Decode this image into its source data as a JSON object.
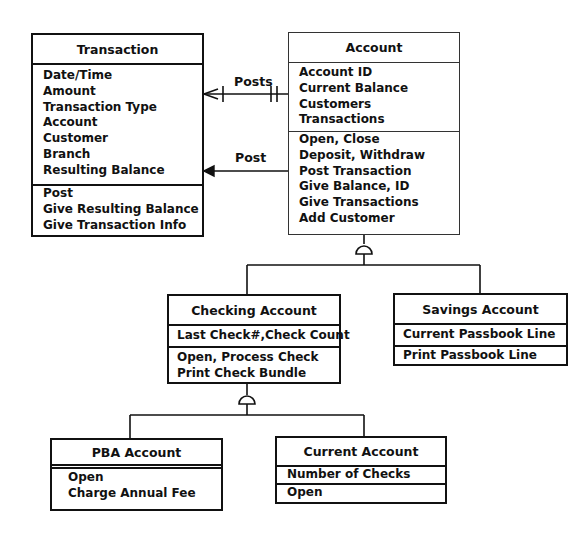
{
  "diagram_type": "UML class diagram",
  "classes": {
    "transaction": {
      "name": "Transaction",
      "attributes": [
        "Date/Time",
        "Amount",
        "Transaction Type",
        "Account",
        "Customer",
        "Branch",
        "Resulting Balance"
      ],
      "operations": [
        "Post",
        "Give Resulting Balance",
        "Give Transaction Info"
      ]
    },
    "account": {
      "name": "Account",
      "attributes": [
        "Account ID",
        "Current Balance",
        "Customers",
        "Transactions"
      ],
      "operations": [
        "Open, Close",
        "Deposit, Withdraw",
        "Post Transaction",
        "Give Balance, ID",
        "Give Transactions",
        "Add Customer"
      ]
    },
    "checking": {
      "name": "Checking Account",
      "attributes": [
        "Last Check#,Check Count"
      ],
      "operations": [
        "Open, Process Check",
        "Print Check Bundle"
      ]
    },
    "savings": {
      "name": "Savings Account",
      "attributes": [
        "Current Passbook Line"
      ],
      "operations": [
        "Print Passbook Line"
      ]
    },
    "pba": {
      "name": "PBA Account",
      "attributes": [],
      "operations": [
        "Open",
        "Charge Annual Fee"
      ]
    },
    "current": {
      "name": "Current Account",
      "attributes": [
        "Number of Checks"
      ],
      "operations": [
        "Open"
      ]
    }
  },
  "relationships": {
    "posts_label": "Posts",
    "post_label": "Post"
  }
}
